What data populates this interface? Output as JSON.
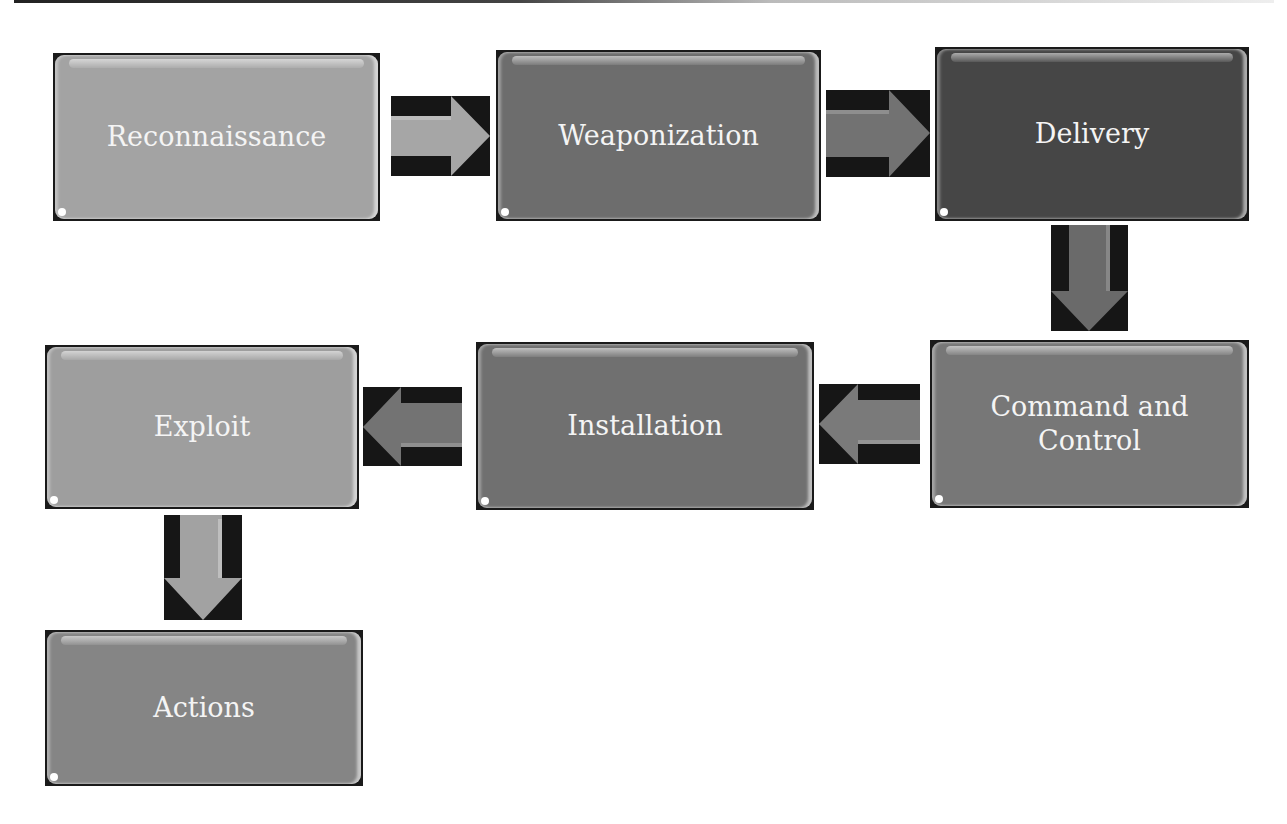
{
  "diagram": {
    "stages": [
      {
        "id": "reconnaissance",
        "label": "Reconnaissance",
        "color": "#a3a3a3"
      },
      {
        "id": "weaponization",
        "label": "Weaponization",
        "color": "#6d6d6d"
      },
      {
        "id": "delivery",
        "label": "Delivery",
        "color": "#464646"
      },
      {
        "id": "command-and-control",
        "label": "Command and Control",
        "color": "#777777"
      },
      {
        "id": "installation",
        "label": "Installation",
        "color": "#707070"
      },
      {
        "id": "exploit",
        "label": "Exploit",
        "color": "#9e9e9e"
      },
      {
        "id": "actions",
        "label": "Actions",
        "color": "#858585"
      }
    ],
    "arrows": [
      {
        "from": "Reconnaissance",
        "to": "Weaponization",
        "direction": "right",
        "color": "#a6a6a6"
      },
      {
        "from": "Weaponization",
        "to": "Delivery",
        "direction": "right",
        "color": "#727272"
      },
      {
        "from": "Delivery",
        "to": "Command and Control",
        "direction": "down",
        "color": "#6a6a6a"
      },
      {
        "from": "Command and Control",
        "to": "Installation",
        "direction": "left",
        "color": "#7a7a7a"
      },
      {
        "from": "Installation",
        "to": "Exploit",
        "direction": "left",
        "color": "#737373"
      },
      {
        "from": "Exploit",
        "to": "Actions",
        "direction": "down",
        "color": "#a2a2a2"
      }
    ]
  }
}
